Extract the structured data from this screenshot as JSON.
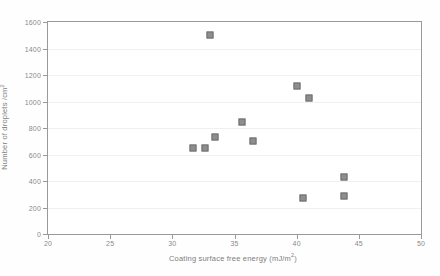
{
  "chart_data": {
    "type": "scatter",
    "title": "",
    "xlabel": "Coating surface free energy (mJ/m²)",
    "ylabel": "Number of droplets /cm²",
    "xlim": [
      20,
      50
    ],
    "ylim": [
      0,
      1600
    ],
    "xticks": [
      20,
      25,
      30,
      35,
      40,
      45,
      50
    ],
    "yticks": [
      0,
      200,
      400,
      600,
      800,
      1000,
      1200,
      1400,
      1600
    ],
    "grid": true,
    "legend": "none",
    "marker": "filled-square",
    "marker_color": "#8e8e8e",
    "series": [
      {
        "name": "droplet count",
        "points": [
          {
            "x": 33.0,
            "y": 1500
          },
          {
            "x": 31.7,
            "y": 650
          },
          {
            "x": 32.6,
            "y": 650
          },
          {
            "x": 33.4,
            "y": 730
          },
          {
            "x": 35.6,
            "y": 845
          },
          {
            "x": 36.5,
            "y": 700
          },
          {
            "x": 40.0,
            "y": 1115
          },
          {
            "x": 41.0,
            "y": 1030
          },
          {
            "x": 40.5,
            "y": 270
          },
          {
            "x": 43.8,
            "y": 430
          },
          {
            "x": 43.8,
            "y": 290
          }
        ]
      }
    ]
  },
  "axis": {
    "y_title_main": "Number of droplets /cm",
    "y_title_sup": "2",
    "x_title_main": "Coating surface free energy (mJ/m",
    "x_title_sup": "2",
    "x_title_tail": ")",
    "ytick_labels": [
      "0",
      "200",
      "400",
      "600",
      "800",
      "1000",
      "1200",
      "1400",
      "1600"
    ],
    "xtick_labels": [
      "20",
      "25",
      "30",
      "35",
      "40",
      "45",
      "50"
    ]
  }
}
